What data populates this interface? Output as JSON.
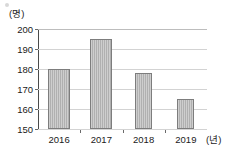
{
  "chart_data": {
    "type": "bar",
    "title": "",
    "subtitle": "",
    "xlabel": "(년)",
    "ylabel": "(명)",
    "categories": [
      "2016",
      "2017",
      "2018",
      "2019"
    ],
    "values": [
      180,
      195,
      178,
      165
    ],
    "series": [
      {
        "name": "",
        "values": [
          180,
          195,
          178,
          165
        ]
      }
    ],
    "ylim": [
      150,
      200
    ],
    "ytick_labels": [
      "150",
      "160",
      "170",
      "180",
      "190",
      "200"
    ],
    "ytick_values": [
      150,
      160,
      170,
      180,
      190,
      200
    ],
    "xtick_labels": [
      "2016",
      "2017",
      "2018",
      "2019"
    ],
    "grid": true,
    "grid_axis": "y",
    "legend": false,
    "legend_position": "none",
    "bar_color": "#b0b0b0",
    "bar_border_color": "#7d7d7d",
    "axis_color": "#4a4a4a",
    "gridline_color": "#d3d3d3",
    "background_color": "#ffffff"
  },
  "axes": {
    "y_unit_label": "(명)",
    "x_unit_label": "(년)",
    "y_ticks": [
      {
        "label": "200",
        "value": 200
      },
      {
        "label": "190",
        "value": 190
      },
      {
        "label": "180",
        "value": 180
      },
      {
        "label": "170",
        "value": 170
      },
      {
        "label": "160",
        "value": 160
      },
      {
        "label": "150",
        "value": 150
      }
    ],
    "x_ticks": [
      {
        "label": "2016",
        "value": 180
      },
      {
        "label": "2017",
        "value": 195
      },
      {
        "label": "2018",
        "value": 178
      },
      {
        "label": "2019",
        "value": 165
      }
    ]
  }
}
